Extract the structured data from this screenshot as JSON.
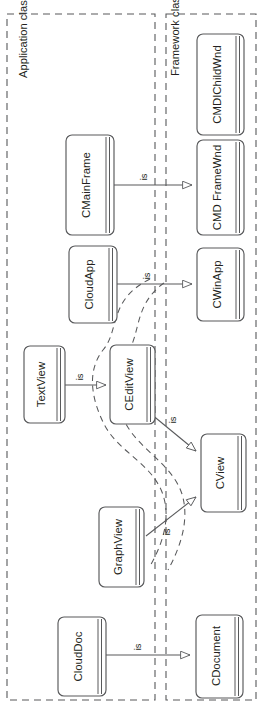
{
  "diagram": {
    "orientation": "rotated-90-ccw",
    "relation_label": "is",
    "colors": {
      "box_stroke": "#58595b",
      "box_fill": "#ffffff",
      "region_border": "#58595b",
      "connector": "#58595b",
      "text": "#231f20",
      "background": "#ffffff"
    }
  },
  "regions": [
    {
      "id": "application",
      "label": "Application classes"
    },
    {
      "id": "framework",
      "label": "Framework classes"
    }
  ],
  "classes": [
    {
      "id": "cmdichildwnd",
      "name": "CMDIChildWnd",
      "region": "framework"
    },
    {
      "id": "cmdiframewnd",
      "name": "CMD FrameWnd",
      "region": "framework"
    },
    {
      "id": "cwinapp",
      "name": "CWinApp",
      "region": "framework"
    },
    {
      "id": "cview",
      "name": "CView",
      "region": "framework"
    },
    {
      "id": "cdocument",
      "name": "CDocument",
      "region": "framework"
    },
    {
      "id": "ceditview",
      "name": "CEditView",
      "region": "framework"
    },
    {
      "id": "cmainframe",
      "name": "CMainFrame",
      "region": "application"
    },
    {
      "id": "cloudapp",
      "name": "CloudApp",
      "region": "application"
    },
    {
      "id": "textview",
      "name": "TextView",
      "region": "application"
    },
    {
      "id": "graphview",
      "name": "GraphView",
      "region": "application"
    },
    {
      "id": "clouddoc",
      "name": "CloudDoc",
      "region": "application"
    }
  ],
  "relations": [
    {
      "id": "r1",
      "from": "cmainframe",
      "to": "cmdiframewnd",
      "label": "is"
    },
    {
      "id": "r2",
      "from": "cloudapp",
      "to": "cwinapp",
      "label": "is"
    },
    {
      "id": "r3",
      "from": "textview",
      "to": "ceditview",
      "label": "is"
    },
    {
      "id": "r4",
      "from": "ceditview",
      "to": "cview",
      "label": "is"
    },
    {
      "id": "r5",
      "from": "graphview",
      "to": "cview",
      "label": "is"
    },
    {
      "id": "r6",
      "from": "clouddoc",
      "to": "cdocument",
      "label": "is"
    }
  ]
}
